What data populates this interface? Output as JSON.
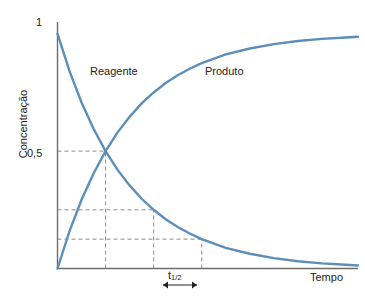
{
  "figure": {
    "background_color": "#ffffff",
    "curve_color": "#5b8fb9",
    "axis_color": "#6e6e6e",
    "grid_color": "#8a8a8a",
    "text_color": "#222222"
  },
  "axes": {
    "y_label": "Concentração",
    "x_label": "Tempo",
    "y_ticks": [
      "1",
      "0,5"
    ],
    "y_tick_values": [
      1,
      0.5
    ],
    "x_ticks": []
  },
  "series_labels": {
    "reagent": "Reagente",
    "product": "Produto"
  },
  "annotation": {
    "half_life_symbol": "t",
    "half_life_subscript": "1/2"
  },
  "chart_data": {
    "type": "line",
    "title": "",
    "xlabel": "Tempo",
    "ylabel": "Concentração",
    "xlim": [
      0,
      6.25
    ],
    "ylim": [
      0,
      1.05
    ],
    "grid": "dashed-guides-only",
    "legend": "inline-labels",
    "x_tick_labels": [],
    "y_tick_labels": [
      "0,5",
      "1"
    ],
    "y_tick_values": [
      0.5,
      1
    ],
    "half_life": 1,
    "guide_lines": {
      "horizontal_at_y": [
        0.5,
        0.25,
        0.125
      ],
      "vertical_at_x": [
        1,
        2,
        3
      ]
    },
    "series": [
      {
        "name": "Reagente",
        "color": "#5b8fb9",
        "equation": "y = 2^(-x)",
        "x": [
          0,
          0.25,
          0.5,
          0.75,
          1,
          1.25,
          1.5,
          1.75,
          2,
          2.25,
          2.5,
          2.75,
          3,
          3.5,
          4,
          4.5,
          5,
          5.5,
          6,
          6.25
        ],
        "values": [
          1.0,
          0.841,
          0.707,
          0.595,
          0.5,
          0.42,
          0.354,
          0.297,
          0.25,
          0.21,
          0.177,
          0.149,
          0.125,
          0.088,
          0.063,
          0.044,
          0.031,
          0.022,
          0.016,
          0.013
        ]
      },
      {
        "name": "Produto",
        "color": "#5b8fb9",
        "equation": "y = 1 - 2^(-x)",
        "x": [
          0,
          0.25,
          0.5,
          0.75,
          1,
          1.25,
          1.5,
          1.75,
          2,
          2.25,
          2.5,
          2.75,
          3,
          3.5,
          4,
          4.5,
          5,
          5.5,
          6,
          6.25
        ],
        "values": [
          0.0,
          0.159,
          0.293,
          0.405,
          0.5,
          0.58,
          0.646,
          0.703,
          0.75,
          0.79,
          0.823,
          0.851,
          0.875,
          0.912,
          0.937,
          0.956,
          0.969,
          0.978,
          0.984,
          0.987
        ]
      }
    ],
    "annotations": [
      {
        "text": "Reagente",
        "x": 0.55,
        "y": 0.79
      },
      {
        "text": "Produto",
        "x": 3.35,
        "y": 0.79
      },
      {
        "text": "t1/2",
        "x": 2.5,
        "y": -0.07,
        "note": "double-headed arrow spanning one half-life"
      }
    ],
    "crossing_point": {
      "x": 1,
      "y": 0.5
    }
  }
}
